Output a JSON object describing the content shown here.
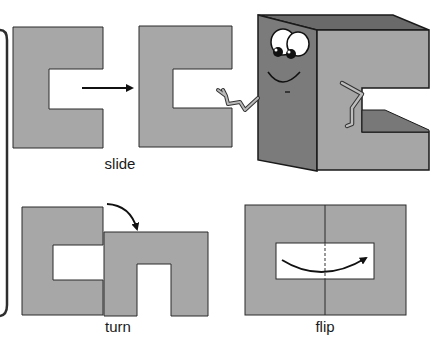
{
  "colors": {
    "background": "#ffffff",
    "shape_fill": "#a7a7a7",
    "shape_stroke": "#2a2a2a",
    "character_front": "#7b7b7b",
    "character_top": "#6a6a6a",
    "character_side": "#a6a6a6",
    "character_inner_shade": "#787878",
    "bracket": "#2e2e2e"
  },
  "panels": {
    "slide": {
      "label": "slide",
      "icon": "arrow-right-icon"
    },
    "turn": {
      "label": "turn",
      "icon": "curved-arrow-down-icon"
    },
    "flip": {
      "label": "flip",
      "icon": "curved-arrow-flip-icon"
    }
  },
  "character": {
    "description": "smiling 3D letter C cartoon with arms",
    "icon": "cartoon-letter-c"
  }
}
